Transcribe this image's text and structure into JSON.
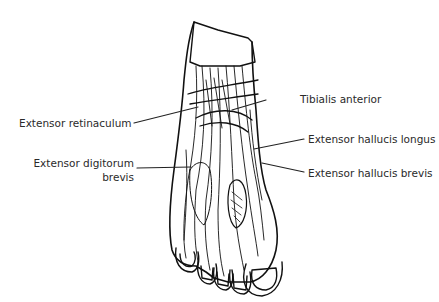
{
  "diagram": {
    "labels": {
      "extensor_retinaculum": "Extensor retinaculum",
      "extensor_digitorum_brevis_1": "Extensor digitorum",
      "extensor_digitorum_brevis_2": "brevis",
      "tibialis_anterior": "Tibialis anterior",
      "extensor_hallucis_longus": "Extensor hallucis longus",
      "extensor_hallucis_brevis": "Extensor hallucis brevis"
    },
    "colors": {
      "line": "#111111",
      "text": "#2a2a2a",
      "background": "#ffffff"
    }
  }
}
